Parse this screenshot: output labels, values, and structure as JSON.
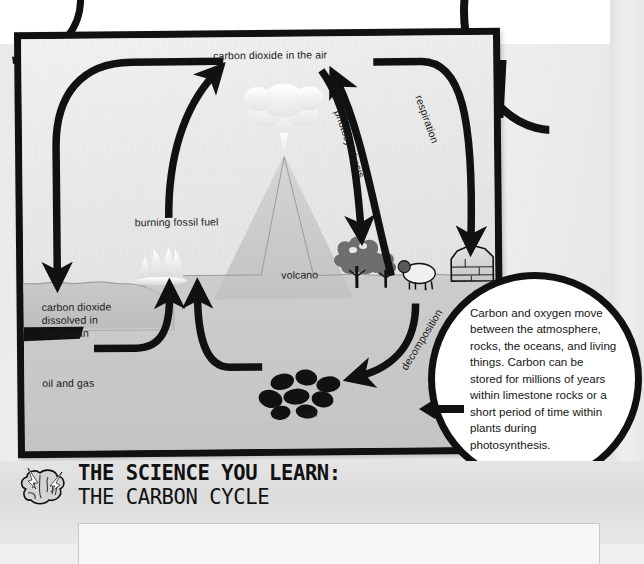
{
  "diagram": {
    "title_alt": "The Carbon Cycle",
    "labels": {
      "co2_air": "carbon dioxide in the air",
      "photosynthesis": "photosynthesis",
      "respiration": "respiration",
      "burning_fossil_fuel": "burning fossil fuel",
      "volcano": "volcano",
      "limestone": "limestone",
      "co2_ocean": "carbon dioxide\ndissolved in\nthe ocean",
      "oil_and_gas": "oil and gas",
      "coal": "coal",
      "decomposition": "decomposition"
    }
  },
  "callout": {
    "text": "Carbon and oxygen move between the atmosphere, rocks, the oceans, and living things. Carbon can be stored for millions of years within limestone rocks or a short period of time within plants during photosynthesis."
  },
  "banner": {
    "title_line1": "THE SCIENCE YOU LEARN:",
    "title_line2": "THE CARBON CYCLE",
    "icon": "brain-icon"
  },
  "colors": {
    "ink": "#111111",
    "page_bg": "#efefef",
    "diagram_bg": "#cfcfcf",
    "sky": "#ededed",
    "callout_bg": "#ffffff"
  }
}
